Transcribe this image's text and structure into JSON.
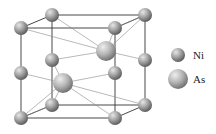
{
  "legend": [
    {
      "label": "Ni",
      "element": "Ni"
    },
    {
      "label": "As",
      "element": "As"
    }
  ],
  "atoms": {
    "Ni": [
      {
        "id": "ni-top-front-left",
        "x": 21,
        "y": 28
      },
      {
        "id": "ni-top-back-left",
        "x": 52,
        "y": 15
      },
      {
        "id": "ni-top-back-right",
        "x": 145,
        "y": 15
      },
      {
        "id": "ni-top-front-right",
        "x": 115,
        "y": 28
      },
      {
        "id": "ni-mid-front-left",
        "x": 21,
        "y": 73
      },
      {
        "id": "ni-mid-back-left",
        "x": 52,
        "y": 60
      },
      {
        "id": "ni-mid-back-right",
        "x": 145,
        "y": 60
      },
      {
        "id": "ni-mid-front-right",
        "x": 115,
        "y": 73
      },
      {
        "id": "ni-bot-front-left",
        "x": 21,
        "y": 118
      },
      {
        "id": "ni-bot-back-left",
        "x": 52,
        "y": 105
      },
      {
        "id": "ni-bot-back-right",
        "x": 145,
        "y": 105
      },
      {
        "id": "ni-bot-front-right",
        "x": 115,
        "y": 118
      }
    ],
    "As": [
      {
        "id": "as-upper",
        "x": 106,
        "y": 51
      },
      {
        "id": "as-lower",
        "x": 63,
        "y": 83
      }
    ]
  },
  "colors": {
    "line": "#333333",
    "thin_line": "#888888",
    "atom_light": "#d8d8d8",
    "atom_dark": "#6a6a6a"
  }
}
